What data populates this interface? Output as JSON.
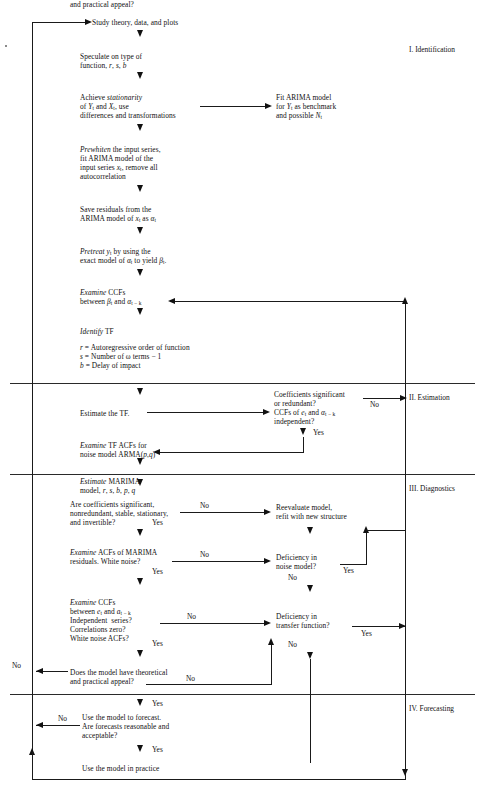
{
  "diagram": {
    "sections": [
      {
        "id": "s1",
        "label": "I. Identification"
      },
      {
        "id": "s2",
        "label": "II. Estimation"
      },
      {
        "id": "s3",
        "label": "III. Diagnostics"
      },
      {
        "id": "s4",
        "label": "IV. Forecasting"
      }
    ],
    "nodes": {
      "study": "Study theory, data, and plots",
      "speculate_l1": "Speculate on type of",
      "speculate_l2": "function, r, s, b",
      "stationarity_l1a": "Achieve ",
      "stationarity_l1b": "stationarity",
      "stationarity_l2": "of Y",
      "stationarity_l2b": " and X",
      "stationarity_l2c": " use",
      "stationarity_l3": "differences and transformations",
      "fitarima_l1": "Fit ARIMA model",
      "fitarima_l2": "for Y",
      "fitarima_l2b": " as benchmark",
      "fitarima_l3": "and possible N",
      "prewhiten_l1a": "Prewhiten",
      "prewhiten_l1b": " the input series,",
      "prewhiten_l2": "fit ARIMA model of the",
      "prewhiten_l3": "input series x",
      "prewhiten_l3b": " remove all",
      "prewhiten_l4": "autocorrelation",
      "save_l1": "Save residuals from the",
      "save_l2": "ARIMA model of x",
      "save_l2b": " as α",
      "pretreat_l1a": "Pretreat",
      "pretreat_l1b": " y",
      "pretreat_l1c": " by using the",
      "pretreat_l2": "exact model of α",
      "pretreat_l2b": " to yield β",
      "examccf1_l1a": "Examine",
      "examccf1_l1b": " CCFs",
      "examccf1_l2": "between β",
      "examccf1_l2b": " and α",
      "identify_l1a": "Identify",
      "identify_l1b": " TF",
      "identify_r": "r = Autoregressive order of function",
      "identify_s": "s = Number of ω terms − 1",
      "identify_b": "b = Delay of impact",
      "estimate_tf": "Estimate the TF.",
      "coef_l1": "Coefficients significant",
      "coef_l2": "or redundant?",
      "coef_l3": "CCFs of e",
      "coef_l3b": " and α",
      "coef_l4": "independent?",
      "examtf_l1a": "Examine",
      "examtf_l1b": " TF ACFs for",
      "examtf_l2": "noise model ARMA(p,q)",
      "estmarima_l1a": "Estimate",
      "estmarima_l1b": " MARIMA",
      "estmarima_l2": "model, r, s, b, p, q",
      "arecoef_l1": "Are coefficients significant,",
      "arecoef_l2": "nonredundant, stable, stationary,",
      "arecoef_l3": "and invertible?",
      "reeval_l1": "Reevaluate model,",
      "reeval_l2": "refit with new structure",
      "examacf_l1a": "Examine",
      "examacf_l1b": " ACFs of MARIMA",
      "examacf_l2": "residuals. White noise?",
      "defnoise_l1": "Deficiency in",
      "defnoise_l2": "noise model?",
      "examccf2_l1a": "Examine",
      "examccf2_l1b": " CCFs",
      "examccf2_l2": "between e",
      "examccf2_l2b": " and a",
      "examccf2_l3": "Independent  series?",
      "examccf2_l4": "Correlations zero?",
      "examccf2_l5": "White noise ACFs?",
      "deftf_l1": "Deficiency in",
      "deftf_l2": "transfer function?",
      "appeal_l1": "Does the model have theoretical",
      "appeal_l2": "and practical appeal?",
      "forecast_l1": "Use the model to forecast.",
      "forecast_l2": "Are forecasts reasonable and",
      "forecast_l3": "acceptable?",
      "practice": "Use the model in practice"
    },
    "edge_labels": {
      "yes": "Yes",
      "no": "No"
    },
    "subscripts": {
      "t": "t",
      "t_minus_k": "t − k"
    },
    "colors": {
      "line": "#1a1a1a",
      "text": "#111111",
      "background": "#ffffff"
    }
  }
}
